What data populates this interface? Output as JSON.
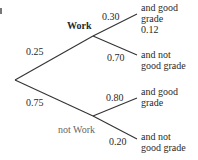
{
  "diagram": {
    "type": "probability-tree",
    "nodes": {
      "work": "Work",
      "not_work": "not Work"
    },
    "branch_probs": {
      "root_to_work": "0.25",
      "root_to_not_work": "0.75",
      "work_to_good": "0.30",
      "work_to_not_good": "0.70",
      "not_work_to_good": "0.80",
      "not_work_to_not_good": "0.20"
    },
    "outcomes": {
      "work_good_line1": "and good",
      "work_good_line2": "grade",
      "work_good_result": "0.12",
      "work_not_good_line1": "and not",
      "work_not_good_line2": "good grade",
      "not_work_good_line1": "and good",
      "not_work_good_line2": "grade",
      "not_work_not_good_line1": "and not",
      "not_work_not_good_line2": "good grade"
    }
  }
}
